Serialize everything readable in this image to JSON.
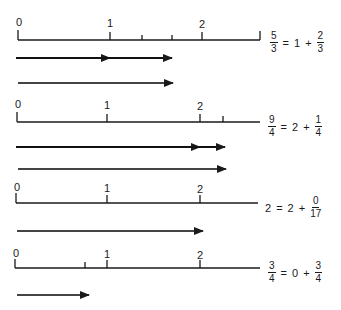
{
  "diagram": {
    "title": "",
    "sections": [
      {
        "id": "five-thirds",
        "axis_labels": [
          "0",
          "1",
          "2"
        ],
        "equation": {
          "lhs_num": "5",
          "lhs_den": "3",
          "eq": "=",
          "whole": "1",
          "plus": "+",
          "frac_num": "2",
          "frac_den": "3"
        }
      },
      {
        "id": "nine-fourths",
        "axis_labels": [
          "0",
          "1",
          "2"
        ],
        "equation": {
          "lhs_num": "9",
          "lhs_den": "4",
          "eq": "=",
          "whole": "2",
          "plus": "+",
          "frac_num": "1",
          "frac_den": "4"
        }
      },
      {
        "id": "two",
        "axis_labels": [
          "0",
          "1",
          "2"
        ],
        "equation": {
          "lhs": "2",
          "eq": "=",
          "whole": "2",
          "plus": "+",
          "frac_num": "0",
          "frac_den": "17"
        }
      },
      {
        "id": "three-fourths",
        "axis_labels": [
          "0",
          "1",
          "2"
        ],
        "equation": {
          "lhs_num": "3",
          "lhs_den": "4",
          "eq": "=",
          "whole": "0",
          "plus": "+",
          "frac_num": "3",
          "frac_den": "4"
        }
      }
    ],
    "colors": {
      "ink": "#1a1a1a",
      "arrow_dark": "#111111",
      "arrow_gray": "#444444"
    }
  }
}
